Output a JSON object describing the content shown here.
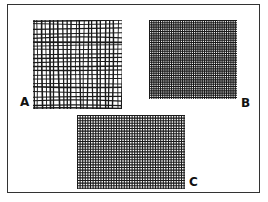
{
  "figure": {
    "panels": [
      {
        "id": "A",
        "label": "A",
        "description": "coarse irregular woven mesh",
        "grid_spacing": 4.2,
        "stroke_width": 1.3,
        "wavy": true
      },
      {
        "id": "B",
        "label": "B",
        "description": "fine dense woven mesh",
        "grid_spacing": 2.2,
        "stroke_width": 1.1,
        "wavy": false
      },
      {
        "id": "C",
        "label": "C",
        "description": "medium dense regular woven mesh",
        "grid_spacing": 2.6,
        "stroke_width": 1.1,
        "wavy": false
      }
    ],
    "colors": {
      "ink": "#1a1a1a",
      "background": "#ffffff",
      "border": "#333333"
    }
  }
}
